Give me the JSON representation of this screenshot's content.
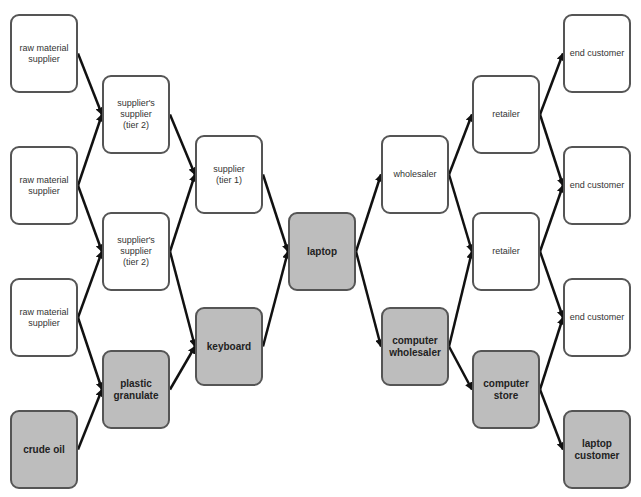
{
  "diagram": {
    "type": "supply-chain-network",
    "colors": {
      "highlight_fill": "#bdbdbd",
      "normal_fill": "#ffffff",
      "border": "#555555",
      "arrow": "#111111"
    },
    "nodes": [
      {
        "id": "raw1",
        "label": "raw material\nsupplier",
        "highlight": false,
        "x": 10,
        "y": 14
      },
      {
        "id": "raw2",
        "label": "raw material\nsupplier",
        "highlight": false,
        "x": 10,
        "y": 146
      },
      {
        "id": "raw3",
        "label": "raw material\nsupplier",
        "highlight": false,
        "x": 10,
        "y": 278
      },
      {
        "id": "crude",
        "label": "crude oil",
        "highlight": true,
        "x": 10,
        "y": 410
      },
      {
        "id": "s2a",
        "label": "supplier's\nsupplier\n(tier 2)",
        "highlight": false,
        "x": 102,
        "y": 75
      },
      {
        "id": "s2b",
        "label": "supplier's\nsupplier\n(tier 2)",
        "highlight": false,
        "x": 102,
        "y": 212
      },
      {
        "id": "plastic",
        "label": "plastic\ngranulate",
        "highlight": true,
        "x": 102,
        "y": 350
      },
      {
        "id": "sup1",
        "label": "supplier\n(tier 1)",
        "highlight": false,
        "x": 195,
        "y": 135
      },
      {
        "id": "keyboard",
        "label": "keyboard",
        "highlight": true,
        "x": 195,
        "y": 307
      },
      {
        "id": "laptop",
        "label": "laptop",
        "highlight": true,
        "x": 288,
        "y": 212
      },
      {
        "id": "wholesaler",
        "label": "wholesaler",
        "highlight": false,
        "x": 381,
        "y": 135
      },
      {
        "id": "compwh",
        "label": "computer\nwholesaler",
        "highlight": true,
        "x": 381,
        "y": 307
      },
      {
        "id": "ret1",
        "label": "retailer",
        "highlight": false,
        "x": 472,
        "y": 75
      },
      {
        "id": "ret2",
        "label": "retailer",
        "highlight": false,
        "x": 472,
        "y": 212
      },
      {
        "id": "compstore",
        "label": "computer\nstore",
        "highlight": true,
        "x": 472,
        "y": 350
      },
      {
        "id": "end1",
        "label": "end customer",
        "highlight": false,
        "x": 563,
        "y": 14
      },
      {
        "id": "end2",
        "label": "end customer",
        "highlight": false,
        "x": 563,
        "y": 146
      },
      {
        "id": "end3",
        "label": "end customer",
        "highlight": false,
        "x": 563,
        "y": 278
      },
      {
        "id": "lapcust",
        "label": "laptop\ncustomer",
        "highlight": true,
        "x": 563,
        "y": 410
      }
    ],
    "edges": [
      [
        "raw1",
        "s2a"
      ],
      [
        "raw2",
        "s2a"
      ],
      [
        "raw2",
        "s2b"
      ],
      [
        "raw3",
        "s2b"
      ],
      [
        "raw3",
        "plastic"
      ],
      [
        "crude",
        "plastic"
      ],
      [
        "s2a",
        "sup1"
      ],
      [
        "s2b",
        "sup1"
      ],
      [
        "s2b",
        "keyboard"
      ],
      [
        "plastic",
        "keyboard"
      ],
      [
        "sup1",
        "laptop"
      ],
      [
        "keyboard",
        "laptop"
      ],
      [
        "laptop",
        "wholesaler"
      ],
      [
        "laptop",
        "compwh"
      ],
      [
        "wholesaler",
        "ret1"
      ],
      [
        "wholesaler",
        "ret2"
      ],
      [
        "compwh",
        "ret2"
      ],
      [
        "compwh",
        "compstore"
      ],
      [
        "ret1",
        "end1"
      ],
      [
        "ret1",
        "end2"
      ],
      [
        "ret2",
        "end2"
      ],
      [
        "ret2",
        "end3"
      ],
      [
        "compstore",
        "end3"
      ],
      [
        "compstore",
        "lapcust"
      ]
    ],
    "node_size": {
      "w": 68,
      "h": 79
    }
  }
}
